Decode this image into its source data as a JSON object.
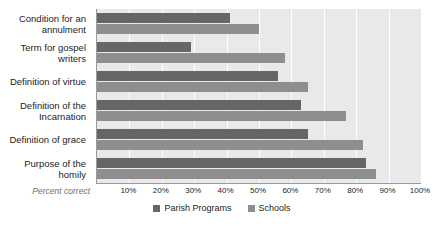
{
  "chart_data": {
    "type": "bar",
    "orientation": "horizontal",
    "title": "",
    "xlabel": "Percent correct",
    "ylabel": "",
    "xlim": [
      0,
      100
    ],
    "grid": true,
    "legend_position": "bottom-center",
    "tick_labels": [
      "10%",
      "20%",
      "30%",
      "40%",
      "50%",
      "60%",
      "70%",
      "80%",
      "90%",
      "100%"
    ],
    "tick_values": [
      10,
      20,
      30,
      40,
      50,
      60,
      70,
      80,
      90,
      100
    ],
    "categories": [
      "Condition for an annulment",
      "Term for gospel writers",
      "Definition of virtue",
      "Definition of the Incarnation",
      "Definition of grace",
      "Purpose of the homily"
    ],
    "series": [
      {
        "name": "Parish Programs",
        "color": "#666666",
        "values": [
          41,
          29,
          56,
          63,
          65,
          83
        ]
      },
      {
        "name": "Schools",
        "color": "#8e8e8e",
        "values": [
          50,
          58,
          65,
          77,
          82,
          86
        ]
      }
    ]
  },
  "axis": {
    "caption": "Percent correct"
  },
  "legend": {
    "items": [
      {
        "label": "Parish Programs"
      },
      {
        "label": "Schools"
      }
    ]
  },
  "colors": {
    "parish": "#666666",
    "schools": "#8e8e8e",
    "plot_background": "#e9e9e9",
    "gridline": "#ffffff",
    "axis": "#9a9a9a"
  }
}
